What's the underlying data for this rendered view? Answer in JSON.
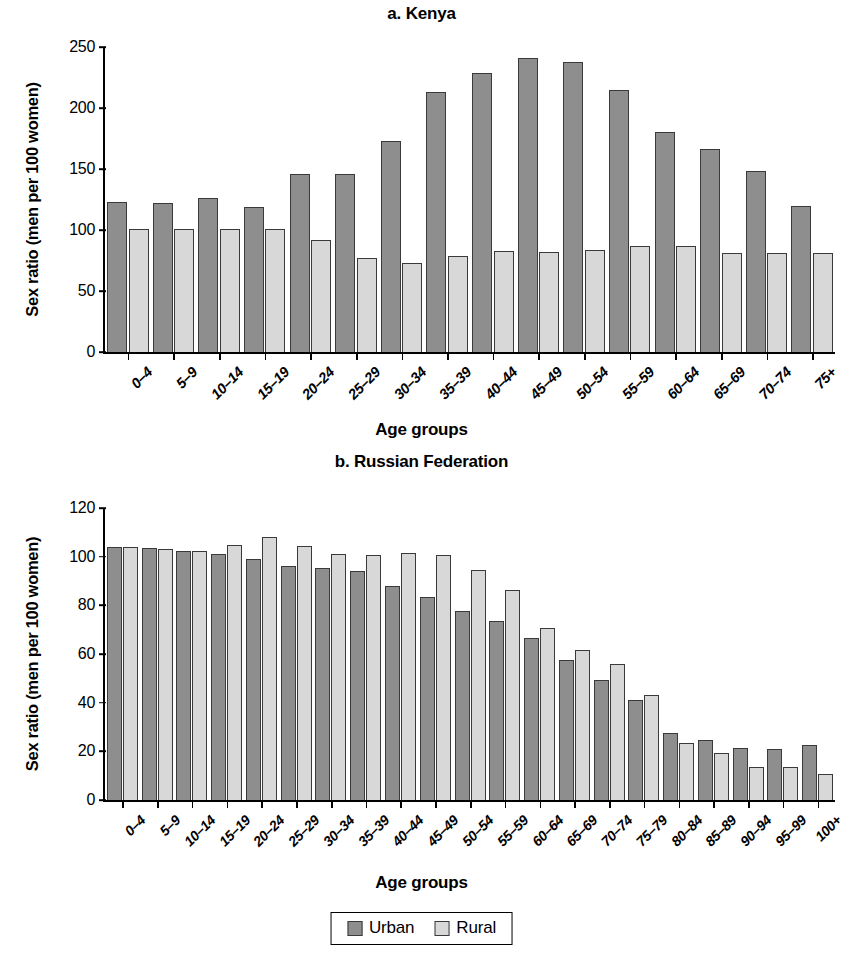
{
  "legend": {
    "items": [
      {
        "label": "Urban",
        "color": "#8e8e8e",
        "key": "urban"
      },
      {
        "label": "Rural",
        "color": "#d8d8d8",
        "key": "rural"
      }
    ]
  },
  "colors": {
    "urban": "#8e8e8e",
    "rural": "#d8d8d8",
    "bar_outline": "#3a3a3a",
    "axis": "#000000",
    "background": "#ffffff"
  },
  "chart_data": [
    {
      "type": "bar",
      "id": "kenya",
      "title": "a. Kenya",
      "xlabel": "Age groups",
      "ylabel": "Sex ratio (men per 100 women)",
      "ylim": [
        0,
        250
      ],
      "yticks": [
        0,
        50,
        100,
        150,
        200,
        250
      ],
      "grid": false,
      "legend_position": "bottom",
      "categories": [
        "0–4",
        "5–9",
        "10–14",
        "15–19",
        "20–24",
        "25–29",
        "30–34",
        "35–39",
        "40–44",
        "45–49",
        "50–54",
        "55–59",
        "60–64",
        "65–69",
        "70–74",
        "75+"
      ],
      "series": [
        {
          "name": "Urban",
          "values": [
            123,
            122,
            126,
            119,
            146,
            146,
            173,
            213,
            229,
            241,
            238,
            215,
            180,
            166,
            148,
            120
          ]
        },
        {
          "name": "Rural",
          "values": [
            101,
            101,
            101,
            101,
            92,
            77,
            73,
            79,
            83,
            82,
            84,
            87,
            87,
            81,
            81,
            81
          ]
        }
      ]
    },
    {
      "type": "bar",
      "id": "russian-federation",
      "title": "b. Russian Federation",
      "xlabel": "Age groups",
      "ylabel": "Sex ratio (men per 100 women)",
      "ylim": [
        0,
        120
      ],
      "yticks": [
        0,
        20,
        40,
        60,
        80,
        100,
        120
      ],
      "grid": false,
      "legend_position": "bottom",
      "categories": [
        "0–4",
        "5–9",
        "10–14",
        "15–19",
        "20–24",
        "25–29",
        "30–34",
        "35–39",
        "40–44",
        "45–49",
        "50–54",
        "55–59",
        "60–64",
        "65–69",
        "70–74",
        "75–79",
        "80–84",
        "85–89",
        "90–94",
        "95–99",
        "100+"
      ],
      "series": [
        {
          "name": "Urban",
          "values": [
            104,
            103.5,
            102.5,
            101,
            99,
            96,
            95.5,
            94,
            88,
            83.5,
            77.5,
            73.5,
            66.5,
            57.5,
            49.5,
            41,
            27.5,
            24.5,
            21.5,
            21,
            22.5
          ]
        },
        {
          "name": "Rural",
          "values": [
            104,
            103,
            102.5,
            105,
            108,
            104.5,
            101,
            100.5,
            101.5,
            100.5,
            94.5,
            86.5,
            70.5,
            61.5,
            56,
            43,
            23.5,
            19.5,
            13.5,
            13.5,
            10.5
          ]
        }
      ]
    }
  ]
}
